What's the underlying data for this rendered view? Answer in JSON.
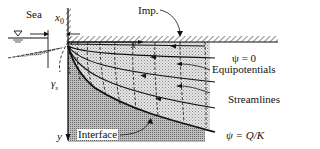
{
  "labels": {
    "sea": "Sea",
    "x0": "x",
    "x0_sub": "0",
    "imp": "Imp.",
    "x_axis": "x",
    "psi_zero": "ψ = 0",
    "equipotentials": "Equipotentials",
    "streamlines": "Streamlines",
    "psi_qk": "ψ = Q/K",
    "gamma_s": "γ",
    "gamma_sub": "s",
    "y_axis": "y",
    "interface": "Interface"
  },
  "colors": {
    "line": "#111111",
    "salt_fill": "#b5b5b5",
    "fresh_fill": "#d8d8d8"
  }
}
